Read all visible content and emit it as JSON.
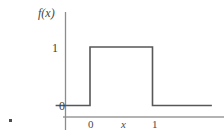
{
  "figure": {
    "background_color": "#ffffff",
    "width": 224,
    "height": 139,
    "stray_mark_color": "#4d4d4d"
  },
  "axes": {
    "y_axis": {
      "name": "y-axis-line",
      "color": "#8c8c8c",
      "x_px": 65,
      "y_top_px": 12,
      "y_bottom_px": 130
    },
    "x_axis": {
      "name": "x-axis-line",
      "color": "#9a9a9a",
      "y_px": 117,
      "x_left_px": 63,
      "x_right_px": 224
    }
  },
  "labels": {
    "y_axis_label": "f(x)",
    "x_axis_label": "x",
    "y_tick_one": "1",
    "y_tick_zero": "0",
    "x_tick_zero": "0",
    "x_tick_one": "1"
  },
  "chart_data": {
    "type": "line",
    "title": "",
    "subtitle": "",
    "xlabel": "x",
    "ylabel": "f(x)",
    "x": [
      -0.55,
      0,
      0,
      1,
      1,
      1.95
    ],
    "values": [
      0,
      0,
      1,
      1,
      0,
      0
    ],
    "series": [
      {
        "name": "f(x)",
        "description": "rectangular pulse, unit height on [0, 1]",
        "x": [
          -0.55,
          0,
          0,
          1,
          1,
          1.95
        ],
        "values": [
          0,
          0,
          1,
          1,
          0,
          0
        ],
        "color": "#575757",
        "line_width": 1.6
      }
    ],
    "xticks": [
      0,
      1
    ],
    "xticklabels": [
      "0",
      "1"
    ],
    "yticks": [
      0,
      1
    ],
    "yticklabels": [
      "0",
      "1"
    ],
    "xlim": [
      -0.55,
      1.95
    ],
    "ylim": [
      -0.2,
      1.25
    ],
    "grid": false,
    "legend": null,
    "annotations": []
  }
}
